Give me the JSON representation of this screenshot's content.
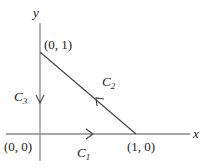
{
  "diagram": {
    "axes": {
      "x_label": "x",
      "y_label": "y"
    },
    "points": [
      {
        "name": "origin",
        "label": "(0, 0)"
      },
      {
        "name": "point-1-0",
        "label": "(1, 0)"
      },
      {
        "name": "point-0-1",
        "label": "(0, 1)"
      }
    ],
    "curves": [
      {
        "name": "C1",
        "letter": "C",
        "sub": "1",
        "from": "(0, 0)",
        "to": "(1, 0)",
        "direction": "right"
      },
      {
        "name": "C2",
        "letter": "C",
        "sub": "2",
        "from": "(1, 0)",
        "to": "(0, 1)",
        "direction": "up-left"
      },
      {
        "name": "C3",
        "letter": "C",
        "sub": "3",
        "from": "(0, 1)",
        "to": "(0, 0)",
        "direction": "down"
      }
    ],
    "colors": {
      "axis": "#8a8a8a",
      "curve": "#404040",
      "text": "#222222"
    }
  }
}
